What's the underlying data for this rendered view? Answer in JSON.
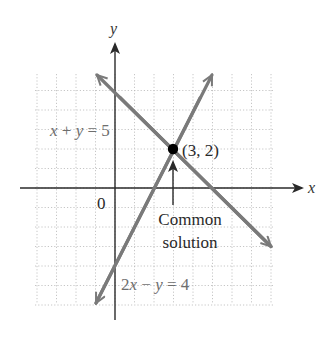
{
  "figure": {
    "axes": {
      "x_label": "x",
      "y_label": "y",
      "origin_label": "0"
    },
    "lines": [
      {
        "name": "x + y = 5",
        "label_parts": [
          "x",
          " + ",
          "y",
          " = 5"
        ],
        "equation": "x + y = 5",
        "color": "#7a7a7a"
      },
      {
        "name": "2x - y = 4",
        "label_parts": [
          "2",
          "x",
          " − ",
          "y",
          " = 4"
        ],
        "equation": "2x − y = 4",
        "color": "#7a7a7a"
      }
    ],
    "point": {
      "label": "(3, 2)",
      "x": 3,
      "y": 2,
      "color": "#000000"
    },
    "annotation": {
      "line1": "Common",
      "line2": "solution"
    }
  },
  "chart_data": {
    "type": "line",
    "title": "",
    "xlabel": "x",
    "ylabel": "y",
    "xlim": [
      -4,
      8
    ],
    "ylim": [
      -6,
      6
    ],
    "grid": true,
    "series": [
      {
        "name": "x + y = 5",
        "x": [
          -1,
          8
        ],
        "y": [
          6,
          -3
        ]
      },
      {
        "name": "2x - y = 4",
        "x": [
          -1,
          5
        ],
        "y": [
          -6,
          6
        ]
      }
    ],
    "points": [
      {
        "x": 3,
        "y": 2,
        "label": "(3, 2)"
      }
    ],
    "annotations": [
      {
        "text": "Common solution",
        "target": [
          3,
          2
        ]
      }
    ]
  }
}
